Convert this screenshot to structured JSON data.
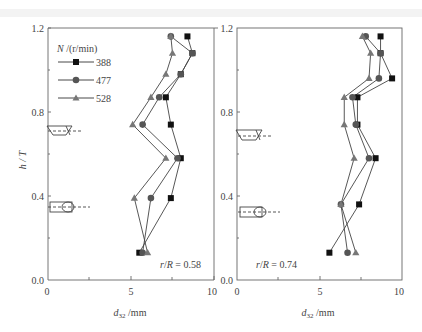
{
  "chart_data": [
    {
      "type": "line",
      "panel": "left",
      "annotation": "r/R = 0.58",
      "xlabel": "d32 /mm",
      "ylabel": "h / T",
      "xlim": [
        0,
        10
      ],
      "ylim": [
        0.0,
        1.2
      ],
      "xticks": [
        "0",
        "5",
        "10"
      ],
      "yticks": [
        "0.0",
        "0.4",
        "0.8",
        "1.2"
      ],
      "legend_title": "N /(r/min)",
      "legend_position": "upper-left",
      "series": [
        {
          "name": "388",
          "marker": "square",
          "points": [
            [
              5.5,
              0.13
            ],
            [
              7.4,
              0.39
            ],
            [
              8.0,
              0.58
            ],
            [
              7.4,
              0.74
            ],
            [
              7.1,
              0.87
            ],
            [
              8.0,
              0.98
            ],
            [
              8.7,
              1.08
            ],
            [
              8.4,
              1.16
            ]
          ]
        },
        {
          "name": "477",
          "marker": "circle",
          "points": [
            [
              5.7,
              0.13
            ],
            [
              6.2,
              0.39
            ],
            [
              7.8,
              0.58
            ],
            [
              5.7,
              0.74
            ],
            [
              6.7,
              0.87
            ],
            [
              8.0,
              0.98
            ],
            [
              8.7,
              1.08
            ],
            [
              7.4,
              1.16
            ]
          ]
        },
        {
          "name": "528",
          "marker": "triangle",
          "points": [
            [
              6.0,
              0.13
            ],
            [
              5.2,
              0.39
            ],
            [
              7.1,
              0.58
            ],
            [
              5.1,
              0.74
            ],
            [
              6.2,
              0.87
            ],
            [
              7.1,
              0.98
            ],
            [
              7.5,
              1.08
            ],
            [
              7.4,
              1.16
            ]
          ]
        }
      ]
    },
    {
      "type": "line",
      "panel": "right",
      "annotation": "r/R = 0.74",
      "xlabel": "d32 /mm",
      "ylabel": "",
      "xlim": [
        0,
        10
      ],
      "ylim": [
        0.0,
        1.2
      ],
      "xticks": [
        "0",
        "5",
        "10"
      ],
      "yticks": [
        "0.0",
        "0.4",
        "0.8",
        "1.2"
      ],
      "series": [
        {
          "name": "388",
          "marker": "square",
          "points": [
            [
              5.6,
              0.13
            ],
            [
              7.4,
              0.36
            ],
            [
              8.4,
              0.58
            ],
            [
              7.3,
              0.74
            ],
            [
              7.3,
              0.87
            ],
            [
              9.4,
              0.96
            ],
            [
              8.7,
              1.08
            ],
            [
              8.7,
              1.16
            ]
          ]
        },
        {
          "name": "477",
          "marker": "circle",
          "points": [
            [
              6.7,
              0.13
            ],
            [
              6.3,
              0.36
            ],
            [
              8.0,
              0.58
            ],
            [
              7.2,
              0.74
            ],
            [
              7.0,
              0.87
            ],
            [
              8.6,
              0.96
            ],
            [
              8.7,
              1.08
            ],
            [
              7.8,
              1.16
            ]
          ]
        },
        {
          "name": "528",
          "marker": "triangle",
          "points": [
            [
              7.2,
              0.13
            ],
            [
              6.3,
              0.36
            ],
            [
              7.1,
              0.58
            ],
            [
              6.5,
              0.74
            ],
            [
              6.5,
              0.87
            ],
            [
              8.0,
              0.96
            ],
            [
              8.1,
              1.08
            ],
            [
              7.6,
              1.16
            ]
          ]
        }
      ]
    }
  ],
  "labels": {
    "legend_title": "N /(r/min)",
    "legend_388": "388",
    "legend_477": "477",
    "legend_528": "528",
    "ylabel": "h / T",
    "xlabel_left": "d32 /mm",
    "xlabel_right": "d32 /mm",
    "annot_left": "r/R = 0.58",
    "annot_right": "r/R = 0.74",
    "y_0": "0.0",
    "y_04": "0.4",
    "y_08": "0.8",
    "y_12": "1.2",
    "x_0": "0",
    "x_5": "5",
    "x_10": "10"
  }
}
